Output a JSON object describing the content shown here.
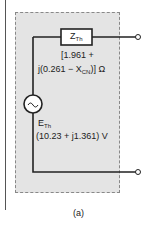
{
  "diagram": {
    "impedance": {
      "symbol": "Z",
      "subscript": "Th",
      "value_line1": "[1.961 +",
      "value_line2_a": "j(0.261 − X",
      "value_line2_sub": "CN",
      "value_line2_b": ")] Ω"
    },
    "source": {
      "symbol": "E",
      "subscript": "Th",
      "value": "(10.23 + j1.361) V",
      "icon": "ac-source-icon"
    },
    "caption": "(a)",
    "colors": {
      "wire": "#222222",
      "box_fill": "#e4e4e4",
      "box_border": "#888888"
    }
  }
}
